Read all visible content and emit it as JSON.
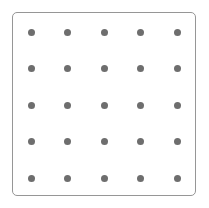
{
  "canvas": {
    "width": 209,
    "height": 208,
    "background_color": "#ffffff"
  },
  "panel": {
    "name": "dot-grid-panel",
    "x": 12,
    "y": 12,
    "width": 184,
    "height": 184,
    "border_color": "#969696",
    "border_width": 1,
    "corner_radius": 5,
    "fill_color": "#ffffff"
  },
  "chart_data": {
    "type": "scatter",
    "title": "",
    "subtitle": "",
    "xlabel": "",
    "ylabel": "",
    "grid": false,
    "legend": null,
    "rows": 5,
    "columns": 5,
    "point_count": 25,
    "point_color": "#6e6e6e",
    "point_diameter": 7,
    "x_spacing": 36.5,
    "y_spacing": 36.5,
    "x_origin": 31,
    "y_origin": 32,
    "xlim": [
      12,
      196
    ],
    "ylim": [
      12,
      196
    ],
    "x": [
      31,
      67.5,
      104,
      140.5,
      177,
      31,
      67.5,
      104,
      140.5,
      177,
      31,
      67.5,
      104,
      140.5,
      177,
      31,
      67.5,
      104,
      140.5,
      177,
      31,
      67.5,
      104,
      140.5,
      177
    ],
    "y": [
      32,
      32,
      32,
      32,
      32,
      68.5,
      68.5,
      68.5,
      68.5,
      68.5,
      105,
      105,
      105,
      105,
      105,
      141.5,
      141.5,
      141.5,
      141.5,
      141.5,
      178,
      178,
      178,
      178,
      178
    ],
    "points": [
      {
        "row": 0,
        "col": 0,
        "x": 31,
        "y": 32
      },
      {
        "row": 0,
        "col": 1,
        "x": 67.5,
        "y": 32
      },
      {
        "row": 0,
        "col": 2,
        "x": 104,
        "y": 32
      },
      {
        "row": 0,
        "col": 3,
        "x": 140.5,
        "y": 32
      },
      {
        "row": 0,
        "col": 4,
        "x": 177,
        "y": 32
      },
      {
        "row": 1,
        "col": 0,
        "x": 31,
        "y": 68.5
      },
      {
        "row": 1,
        "col": 1,
        "x": 67.5,
        "y": 68.5
      },
      {
        "row": 1,
        "col": 2,
        "x": 104,
        "y": 68.5
      },
      {
        "row": 1,
        "col": 3,
        "x": 140.5,
        "y": 68.5
      },
      {
        "row": 1,
        "col": 4,
        "x": 177,
        "y": 68.5
      },
      {
        "row": 2,
        "col": 0,
        "x": 31,
        "y": 105
      },
      {
        "row": 2,
        "col": 1,
        "x": 67.5,
        "y": 105
      },
      {
        "row": 2,
        "col": 2,
        "x": 104,
        "y": 105
      },
      {
        "row": 2,
        "col": 3,
        "x": 140.5,
        "y": 105
      },
      {
        "row": 2,
        "col": 4,
        "x": 177,
        "y": 105
      },
      {
        "row": 3,
        "col": 0,
        "x": 31,
        "y": 141.5
      },
      {
        "row": 3,
        "col": 1,
        "x": 67.5,
        "y": 141.5
      },
      {
        "row": 3,
        "col": 2,
        "x": 104,
        "y": 141.5
      },
      {
        "row": 3,
        "col": 3,
        "x": 140.5,
        "y": 141.5
      },
      {
        "row": 3,
        "col": 4,
        "x": 177,
        "y": 141.5
      },
      {
        "row": 4,
        "col": 0,
        "x": 31,
        "y": 178
      },
      {
        "row": 4,
        "col": 1,
        "x": 67.5,
        "y": 178
      },
      {
        "row": 4,
        "col": 2,
        "x": 104,
        "y": 178
      },
      {
        "row": 4,
        "col": 3,
        "x": 140.5,
        "y": 178
      },
      {
        "row": 4,
        "col": 4,
        "x": 177,
        "y": 178
      }
    ]
  }
}
